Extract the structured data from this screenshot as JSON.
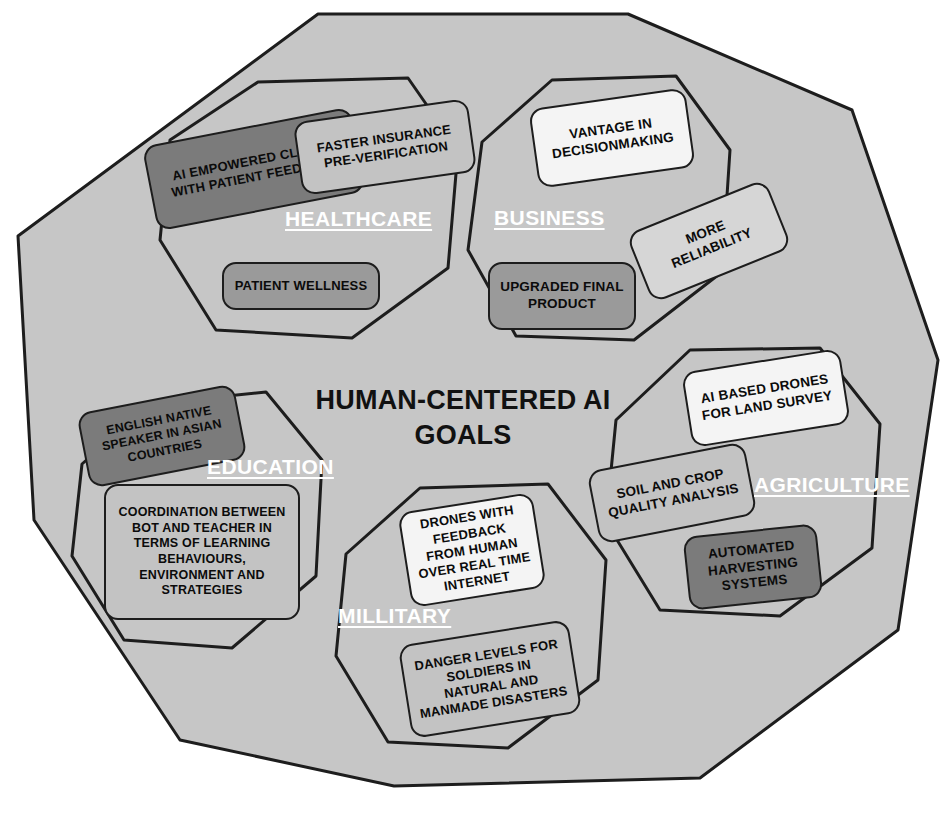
{
  "diagram": {
    "title_line1": "HUMAN-CENTERED AI",
    "title_line2": "GOALS",
    "outer_shape": "decagon",
    "colors": {
      "background": "#ffffff",
      "outer_fill": "#c6c6c6",
      "outline": "#1d1d1d",
      "label_text": "#ffffff",
      "note_text": "#0b0b0b"
    }
  },
  "sections": [
    {
      "id": "healthcare",
      "label": "HEALTHCARE",
      "notes": [
        {
          "text": "AI EMPOWERED CLINICS WITH PATIENT FEEDBACK",
          "tone": "dark"
        },
        {
          "text": "FASTER INSURANCE PRE-VERIFICATION",
          "tone": "light"
        },
        {
          "text": "PATIENT WELLNESS",
          "tone": "mid"
        }
      ]
    },
    {
      "id": "business",
      "label": "BUSINESS",
      "notes": [
        {
          "text": "VANTAGE IN DECISIONMAKING",
          "tone": "white"
        },
        {
          "text": "MORE RELIABILITY",
          "tone": "pale"
        },
        {
          "text": "UPGRADED FINAL PRODUCT",
          "tone": "mid"
        }
      ]
    },
    {
      "id": "agriculture",
      "label": "AGRICULTURE",
      "notes": [
        {
          "text": "AI BASED DRONES FOR LAND SURVEY",
          "tone": "white"
        },
        {
          "text": "SOIL AND CROP QUALITY ANALYSIS",
          "tone": "light"
        },
        {
          "text": "AUTOMATED HARVESTING SYSTEMS",
          "tone": "dark"
        }
      ]
    },
    {
      "id": "education",
      "label": "EDUCATION",
      "notes": [
        {
          "text": "ENGLISH NATIVE SPEAKER IN ASIAN COUNTRIES",
          "tone": "dark"
        },
        {
          "text": "COORDINATION BETWEEN BOT AND TEACHER IN TERMS OF LEARNING BEHAVIOURS, ENVIRONMENT AND STRATEGIES",
          "tone": "light"
        }
      ]
    },
    {
      "id": "millitary",
      "label": "MILLITARY",
      "notes": [
        {
          "text": "DRONES WITH FEEDBACK FROM HUMAN OVER REAL TIME INTERNET",
          "tone": "white"
        },
        {
          "text": "DANGER LEVELS FOR SOLDIERS IN NATURAL AND MANMADE DISASTERS",
          "tone": "light"
        }
      ]
    }
  ],
  "notes_flat": {
    "hc1": "AI EMPOWERED CLINICS WITH PATIENT FEEDBACK",
    "hc2": "FASTER INSURANCE PRE-VERIFICATION",
    "hc3": "PATIENT WELLNESS",
    "bz1": "VANTAGE IN DECISIONMAKING",
    "bz2": "MORE RELIABILITY",
    "bz3": "UPGRADED FINAL PRODUCT",
    "ag1": "AI BASED DRONES FOR LAND SURVEY",
    "ag2": "SOIL AND CROP QUALITY ANALYSIS",
    "ag3": "AUTOMATED HARVESTING SYSTEMS",
    "ed1": "ENGLISH NATIVE SPEAKER IN ASIAN COUNTRIES",
    "ed2": "COORDINATION BETWEEN BOT AND TEACHER IN TERMS OF LEARNING BEHAVIOURS, ENVIRONMENT AND STRATEGIES",
    "ml1": "DRONES WITH FEEDBACK FROM HUMAN OVER REAL TIME INTERNET",
    "ml2": "DANGER LEVELS FOR SOLDIERS IN NATURAL AND MANMADE DISASTERS"
  },
  "labels_flat": {
    "healthcare": "HEALTHCARE",
    "business": "BUSINESS",
    "agriculture": "AGRICULTURE",
    "education": "EDUCATION",
    "millitary": "MILLITARY"
  }
}
